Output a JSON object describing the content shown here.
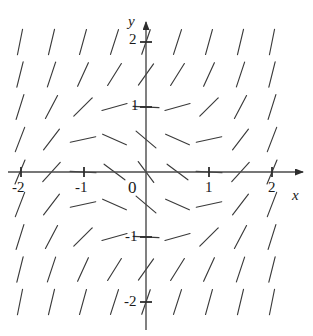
{
  "figure": {
    "kind": "slope-field",
    "background_color": "#ffffff",
    "ink_color": "#3a3a3a",
    "label_color": "#1a1a1a",
    "width": 313,
    "height": 336
  },
  "axes": {
    "x_axis": {
      "label": "x",
      "label_pos": [
        292,
        188
      ],
      "arrow": "right",
      "pixel_y": 172,
      "pixel_x_start": 8,
      "pixel_x_end": 303
    },
    "y_axis": {
      "label": "y",
      "label_pos": [
        128,
        14
      ],
      "arrow": "up",
      "pixel_x": 146,
      "pixel_y_start": 330,
      "pixel_y_end": 22
    },
    "origin_label": "0",
    "origin_label_pos": [
      128,
      179
    ],
    "x_ticks": [
      {
        "value": -2,
        "label": "-2",
        "px": 21,
        "label_pos": [
          12,
          180
        ]
      },
      {
        "value": -1,
        "label": "-1",
        "px": 84,
        "label_pos": [
          75,
          180
        ]
      },
      {
        "value": 1,
        "label": "1",
        "px": 209,
        "label_pos": [
          205,
          180
        ]
      },
      {
        "value": 2,
        "label": "2",
        "px": 272,
        "label_pos": [
          268,
          180
        ]
      }
    ],
    "y_ticks": [
      {
        "value": 2,
        "label": "2",
        "py": 42,
        "label_pos": [
          129,
          32
        ]
      },
      {
        "value": 1,
        "label": "1",
        "py": 107,
        "label_pos": [
          131,
          98
        ]
      },
      {
        "value": -1,
        "label": "-1",
        "py": 237,
        "label_pos": [
          125,
          229
        ]
      },
      {
        "value": -2,
        "label": "-2",
        "py": 302,
        "label_pos": [
          124,
          294
        ]
      }
    ]
  },
  "chart_data": {
    "type": "scatter",
    "title": "",
    "xlabel": "x",
    "ylabel": "y",
    "xlim": [
      -2.3,
      2.3
    ],
    "ylim": [
      -2.3,
      2.3
    ],
    "grid": false,
    "legend": null,
    "x": [
      -2,
      -1.5,
      -1,
      -0.5,
      0,
      0.5,
      1,
      1.5,
      2
    ],
    "y": [
      2,
      1.5,
      1,
      0.5,
      0,
      -0.5,
      -1,
      -1.5,
      -2
    ],
    "segment_length_px": 26,
    "slopes": [
      [
        5.0,
        4.2,
        3.6,
        3.1,
        2.9,
        3.1,
        3.6,
        4.2,
        5.0
      ],
      [
        4.0,
        3.0,
        2.2,
        1.6,
        1.4,
        1.6,
        2.2,
        3.0,
        4.0
      ],
      [
        3.2,
        1.9,
        1.0,
        0.28,
        -0.05,
        0.28,
        1.0,
        1.9,
        3.2
      ],
      [
        2.6,
        1.3,
        0.22,
        -0.45,
        -0.85,
        -0.45,
        0.22,
        1.3,
        2.6
      ],
      [
        2.4,
        1.1,
        -0.05,
        -0.75,
        -1.35,
        -0.75,
        -0.05,
        1.1,
        2.4
      ],
      [
        2.6,
        1.3,
        0.22,
        -0.45,
        -0.85,
        -0.45,
        0.22,
        1.3,
        2.6
      ],
      [
        3.2,
        1.9,
        1.0,
        0.28,
        -0.05,
        0.28,
        1.0,
        1.9,
        3.2
      ],
      [
        4.0,
        3.0,
        2.2,
        1.6,
        1.4,
        1.6,
        2.2,
        3.0,
        4.0
      ],
      [
        5.0,
        4.2,
        3.6,
        3.1,
        2.9,
        3.1,
        3.6,
        4.2,
        5.0
      ]
    ]
  }
}
